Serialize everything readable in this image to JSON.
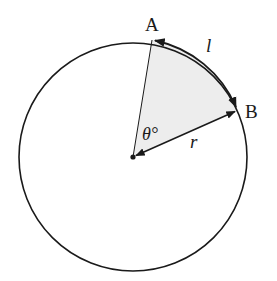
{
  "diagram": {
    "colors": {
      "stroke": "#1a1a1a",
      "sector_fill": "#ededed",
      "background": "#ffffff"
    },
    "circle": {
      "cx": 133,
      "cy": 157,
      "r": 114
    },
    "points": {
      "A": {
        "label": "A",
        "x": 152,
        "y": 40
      },
      "B": {
        "label": "B",
        "x": 238,
        "y": 110
      },
      "O": {
        "x": 133,
        "y": 157
      }
    },
    "labels": {
      "arc": "l",
      "radius": "r",
      "angle": "θ°",
      "point_a": "A",
      "point_b": "B"
    }
  }
}
